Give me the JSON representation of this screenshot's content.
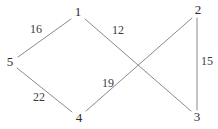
{
  "figure": {
    "type": "weighted-undirected-graph",
    "background_color": "#ffffff",
    "edge_color": "#8a8a8a",
    "label_color": "#2b2b2b",
    "edge_label_color": "#3a3a3a"
  },
  "nodes": [
    {
      "id": "1",
      "label": "1",
      "x": 78,
      "y": 12
    },
    {
      "id": "2",
      "label": "2",
      "x": 198,
      "y": 10
    },
    {
      "id": "3",
      "label": "3",
      "x": 197,
      "y": 117
    },
    {
      "id": "4",
      "label": "4",
      "x": 79,
      "y": 118
    },
    {
      "id": "5",
      "label": "5",
      "x": 10,
      "y": 62
    }
  ],
  "edges": [
    {
      "id": "e-5-1",
      "from": "5",
      "to": "1",
      "weight": "16",
      "x1": 18,
      "y1": 57,
      "x2": 71,
      "y2": 19,
      "label_x": 36,
      "label_y": 29
    },
    {
      "id": "e-1-3",
      "from": "1",
      "to": "3",
      "weight": "12",
      "x1": 85,
      "y1": 19,
      "x2": 191,
      "y2": 111,
      "label_x": 118,
      "label_y": 30
    },
    {
      "id": "e-4-2",
      "from": "4",
      "to": "2",
      "weight": "19",
      "x1": 86,
      "y1": 111,
      "x2": 192,
      "y2": 18,
      "label_x": 108,
      "label_y": 83
    },
    {
      "id": "e-5-4",
      "from": "5",
      "to": "4",
      "weight": "22",
      "x1": 17,
      "y1": 68,
      "x2": 72,
      "y2": 112,
      "label_x": 39,
      "label_y": 97
    },
    {
      "id": "e-2-3",
      "from": "2",
      "to": "3",
      "weight": "15",
      "x1": 197,
      "y1": 18,
      "x2": 197,
      "y2": 110,
      "label_x": 207,
      "label_y": 61
    }
  ]
}
